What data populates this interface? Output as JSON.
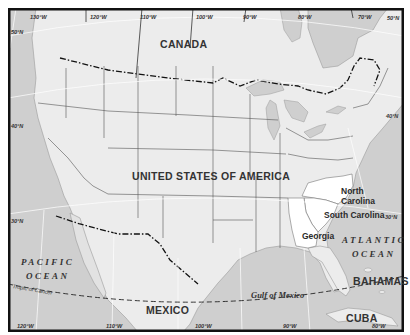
{
  "map": {
    "title": "United States of America with North Carolina, South Carolina and Georgia highlighted",
    "colors": {
      "land": "#ececec",
      "water": "#cfcfcf",
      "highlight": "#ffffff",
      "border": "#111111",
      "frame": "#111111"
    },
    "countries": [
      {
        "name": "CANADA"
      },
      {
        "name": "UNITED STATES OF AMERICA"
      },
      {
        "name": "MEXICO"
      },
      {
        "name": "BAHAMAS"
      },
      {
        "name": "CUBA"
      }
    ],
    "highlighted_states": [
      {
        "name_line1": "North",
        "name_line2": "Carolina"
      },
      {
        "name": "South Carolina"
      },
      {
        "name": "Georgia"
      }
    ],
    "water_bodies": {
      "pacific_line1": "PACIFIC",
      "pacific_line2": "OCEAN",
      "atlantic_line1": "ATLANTIC",
      "atlantic_line2": "OCEAN",
      "gulf": "Gulf of Mexico"
    },
    "tropic_label": "Tropic of Cancer",
    "longitude_labels_top": [
      "130°W",
      "120°W",
      "110°W",
      "100°W",
      "90°W",
      "80°W",
      "70°W"
    ],
    "longitude_labels_bottom": [
      "120°W",
      "110°W",
      "100°W",
      "90°W",
      "80°W"
    ],
    "latitude_labels_left": [
      "50°N",
      "40°N",
      "30°N"
    ],
    "latitude_labels_right": [
      "50°N",
      "40°N",
      "30°N"
    ]
  }
}
